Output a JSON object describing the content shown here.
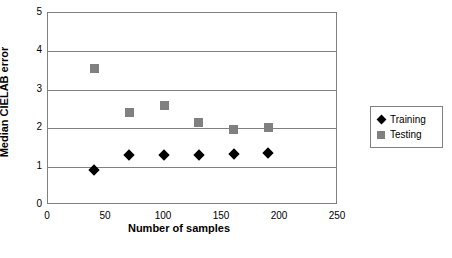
{
  "chart_data": {
    "type": "scatter",
    "title": "",
    "xlabel": "Number of samples",
    "ylabel": "Median CIELAB error",
    "xlim": [
      0,
      250
    ],
    "ylim": [
      0,
      5
    ],
    "xticks": [
      "0",
      "50",
      "100",
      "150",
      "200",
      "250"
    ],
    "yticks": [
      "0",
      "1",
      "2",
      "3",
      "4",
      "5"
    ],
    "grid": "horizontal",
    "legend_position": "right",
    "series": [
      {
        "name": "Training",
        "marker": "diamond",
        "color": "#000000",
        "points": [
          {
            "x": 40,
            "y": 0.9
          },
          {
            "x": 70,
            "y": 1.3
          },
          {
            "x": 100,
            "y": 1.3
          },
          {
            "x": 130,
            "y": 1.3
          },
          {
            "x": 160,
            "y": 1.32
          },
          {
            "x": 190,
            "y": 1.35
          }
        ]
      },
      {
        "name": "Testing",
        "marker": "square",
        "color": "#808080",
        "points": [
          {
            "x": 40,
            "y": 3.55
          },
          {
            "x": 70,
            "y": 2.4
          },
          {
            "x": 100,
            "y": 2.6
          },
          {
            "x": 130,
            "y": 2.15
          },
          {
            "x": 160,
            "y": 1.97
          },
          {
            "x": 190,
            "y": 2.02
          }
        ]
      }
    ]
  },
  "legend": {
    "entries": [
      {
        "label": "Training"
      },
      {
        "label": "Testing"
      }
    ]
  }
}
